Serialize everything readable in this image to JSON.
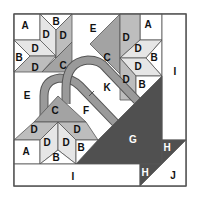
{
  "diagram": {
    "type": "quilt-block-piecing-diagram",
    "colors": {
      "white": "#ffffff",
      "light": "#e6e6e6",
      "medium": "#bdbdbd",
      "mid_dark": "#a3a3a3",
      "dark": "#505050",
      "stem": "#9a9a9a",
      "border": "#555555"
    },
    "labels": {
      "tl_A": "A",
      "tl_B_top": "B",
      "tl_B_left": "B",
      "tl_D1": "D",
      "tl_D2": "D",
      "tl_D3": "D",
      "tl_D4": "D",
      "tl_C": "C",
      "tl_E_top": "E",
      "E_left": "E",
      "tr_A": "A",
      "tr_D1": "D",
      "tr_D2": "D",
      "tr_D3": "D",
      "tr_D4": "D",
      "tr_B1": "B",
      "tr_B2": "B",
      "tr_C": "C",
      "I_right": "I",
      "K": "K",
      "F": "F",
      "bl_C": "C",
      "bl_D1": "D",
      "bl_D2": "D",
      "bl_D3": "D",
      "bl_D4": "D",
      "bl_A": "A",
      "bl_B_bottom": "B",
      "bl_B_right": "B",
      "G": "G",
      "H_upper": "H",
      "H_lower": "H",
      "J": "J",
      "I_bottom": "I"
    }
  }
}
